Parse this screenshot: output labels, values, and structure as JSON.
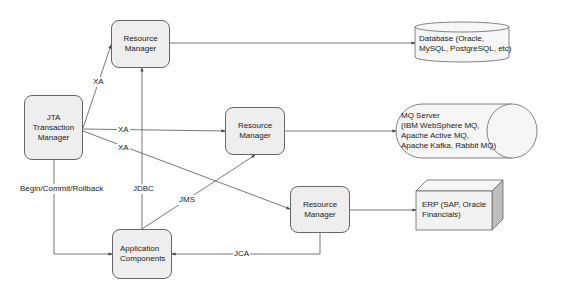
{
  "nodes": {
    "jta": {
      "line1": "JTA",
      "line2": "Transaction",
      "line3": "Manager"
    },
    "rm_db": {
      "line1": "Resource",
      "line2": "Manager"
    },
    "rm_mq": {
      "line1": "Resource",
      "line2": "Manager"
    },
    "rm_erp": {
      "line1": "Resource",
      "line2": "Manager"
    },
    "app": {
      "line1": "Application",
      "line2": "Components"
    }
  },
  "external": {
    "database": {
      "line1": "Database (Oracle,",
      "line2": "MySQL, PostgreSQL, etc)",
      "shape": "cylinder"
    },
    "mq": {
      "line1": "MQ Server",
      "line2": "(IBM WebSphere MQ,",
      "line3": "Apache Active MQ,",
      "line4": "Apache Kafka, Rabbit MQ)",
      "shape": "horizontal-cylinder"
    },
    "erp": {
      "line1": "ERP (SAP, Oracle",
      "line2": "Financials)",
      "shape": "cube"
    }
  },
  "edges": {
    "xa_db": "XA",
    "xa_mq": "XA",
    "xa_erp": "XA",
    "begin_commit": "Begin/Commit/Rollback",
    "jdbc": "JDBC",
    "jms": "JMS",
    "jca": "JCA"
  },
  "colors": {
    "node_fill": "#eeeeee",
    "stroke": "#555555",
    "background": "#ffffff"
  }
}
